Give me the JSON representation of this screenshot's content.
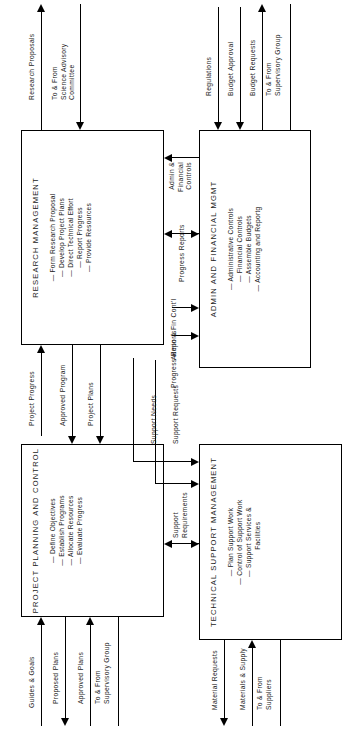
{
  "page": {
    "header_fragment": "MANUAL CONTROL"
  },
  "diagram": {
    "ink_color": "#000000",
    "boxes": [
      {
        "id": "research-management",
        "title": "RESEARCH MANAGEMENT",
        "items": [
          "— Form Research Proposal",
          "— Develop Project Plans",
          "— Direct Technical Effort",
          "— Report Progress",
          "— Provide Resources"
        ]
      },
      {
        "id": "admin-and-financial-mgmt",
        "title": "ADMIN AND FINANCIAL MGMT",
        "items": [
          "— Administrative Controls",
          "— Financial Controls",
          "— Assemble Budgets",
          "— Accounting and Reportg"
        ]
      },
      {
        "id": "project-planning-and-control",
        "title": "PROJECT PLANNING AND CONTROL",
        "items": [
          "— Define Objectives",
          "— Establish Programs",
          "— Allocate Resources",
          "— Evaluate Progress"
        ]
      },
      {
        "id": "technical-support-management",
        "title": "TECHNICAL SUPPORT MANAGEMENT",
        "items": [
          "— Plan Support Work",
          "— Control of Support Work",
          "— Support Services &",
          "      Facilities"
        ]
      }
    ],
    "flows": {
      "research_proposals": "Research Proposals",
      "science_advisory": "To & From\nScience Advisory\nCommittee",
      "admin_financial_controls": "Admin &\nFinancial\nControls",
      "progress_reports_top": "Progress Reports",
      "regulations": "Regulations",
      "budget_approval": "Budget Approval",
      "budget_requests": "Budget Requests",
      "supervisory_group_right": "To & From\nSupervisory Group",
      "project_progress": "Project Progress",
      "approved_program": "Approved Program",
      "project_plans": "Project Plans",
      "support_requests": "Support Requests",
      "support_needs": "Support Needs",
      "admin_fin_contl": "Admin & Fin Cont'l",
      "progress_reports_bottom": "Progress Reports",
      "support_requirements": "Support\nRequirements",
      "guides_goals": "Guides & Goals",
      "proposed_plans": "Proposed Plans",
      "approved_plans": "Approved Plans",
      "supervisory_group_left": "To & From\nSupervisory Group",
      "material_requests": "Material Requests",
      "materials_supply": "Materials & Supply",
      "suppliers": "To & From\nSuppliers"
    }
  }
}
